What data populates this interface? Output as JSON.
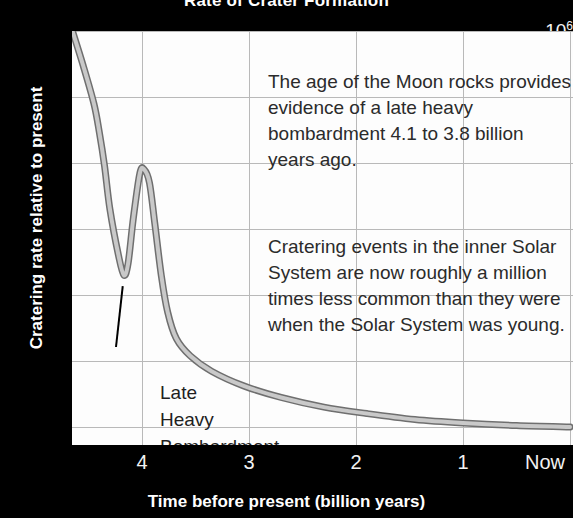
{
  "chart_data": {
    "type": "line",
    "title": "Rate of Crater Formation",
    "xlabel": "Time before present (billion years)",
    "ylabel": "Cratering rate relative to present",
    "xlim": [
      4.65,
      0.0
    ],
    "ylim": [
      1,
      1000000
    ],
    "yscale": "log",
    "xscale": "linear",
    "grid": true,
    "legend": "none",
    "x_tick_labels": [
      "4",
      "3",
      "2",
      "1",
      "Now"
    ],
    "x_tick_values": [
      4,
      3,
      2,
      1,
      0
    ],
    "y_tick_labels": [
      "10⁶",
      "10⁵",
      "10⁴",
      "10³",
      "10²",
      "10",
      "1"
    ],
    "y_tick_values": [
      1000000,
      100000,
      10000,
      1000,
      100,
      10,
      1
    ],
    "series": [
      {
        "name": "Cratering rate",
        "style": "thick-gray-band",
        "color": "#9a9a9a",
        "points": [
          {
            "x": 4.65,
            "y": 1000000
          },
          {
            "x": 4.55,
            "y": 300000
          },
          {
            "x": 4.45,
            "y": 80000
          },
          {
            "x": 4.4,
            "y": 30000
          },
          {
            "x": 4.35,
            "y": 9000
          },
          {
            "x": 4.3,
            "y": 2000
          },
          {
            "x": 4.22,
            "y": 400
          },
          {
            "x": 4.17,
            "y": 200
          },
          {
            "x": 4.13,
            "y": 300
          },
          {
            "x": 4.08,
            "y": 1500
          },
          {
            "x": 4.02,
            "y": 7000
          },
          {
            "x": 3.98,
            "y": 8000
          },
          {
            "x": 3.93,
            "y": 5000
          },
          {
            "x": 3.88,
            "y": 1200
          },
          {
            "x": 3.82,
            "y": 200
          },
          {
            "x": 3.76,
            "y": 55
          },
          {
            "x": 3.68,
            "y": 22
          },
          {
            "x": 3.55,
            "y": 12
          },
          {
            "x": 3.35,
            "y": 7
          },
          {
            "x": 3.05,
            "y": 4.2
          },
          {
            "x": 2.7,
            "y": 2.8
          },
          {
            "x": 2.3,
            "y": 2.0
          },
          {
            "x": 1.9,
            "y": 1.6
          },
          {
            "x": 1.45,
            "y": 1.3
          },
          {
            "x": 1.0,
            "y": 1.15
          },
          {
            "x": 0.5,
            "y": 1.05
          },
          {
            "x": 0.0,
            "y": 1.0
          }
        ]
      }
    ],
    "annotations": [
      {
        "id": "moon-rocks",
        "text": "The age of the Moon rocks provides\nevidence of a late heavy\nbombardment 4.1 to 3.8 billion\nyears ago."
      },
      {
        "id": "cratering-rate",
        "text": "Cratering events in the inner Solar\nSystem are now roughly a million\ntimes less common than they were\nwhen the Solar System was young."
      },
      {
        "id": "late-heavy-bombardment",
        "text": "Late\nHeavy\nBombardment",
        "has_leader_line": true,
        "points_to_x": 4.18,
        "points_to_y": 180
      }
    ],
    "colors": {
      "background": "#000000",
      "plot_background": "#fdfdfd",
      "grid": "#b9b9b9",
      "curve_edge": "#6f6f6f",
      "curve_fill": "#c9c9c9",
      "axis_text": "#ffffff",
      "annotation_text": "#2b2b2b"
    }
  }
}
